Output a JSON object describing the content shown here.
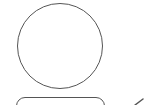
{
  "icon": {
    "name": "user-icon",
    "stroke_color": "#555555",
    "background": "#ffffff",
    "parts": {
      "head": "circle",
      "body": "rounded-rectangle",
      "badge": "check-mark-partial"
    }
  }
}
